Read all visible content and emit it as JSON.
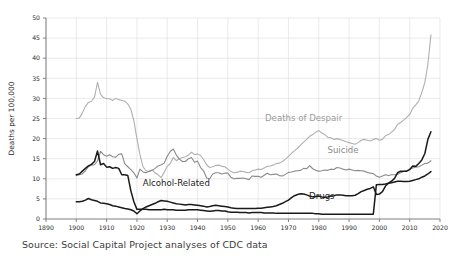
{
  "source_note": "Source: Social Capital Project analyses of CDC data",
  "chart_data": {
    "type": "line",
    "title": "",
    "xlabel": "",
    "ylabel": "Deaths per 100,000",
    "xlim": [
      1890,
      2020
    ],
    "ylim": [
      0,
      50
    ],
    "grid": true,
    "legend": "inline-labels",
    "xticks": [
      1890,
      1900,
      1910,
      1920,
      1930,
      1940,
      1950,
      1960,
      1970,
      1980,
      1990,
      2000,
      2010,
      2020
    ],
    "yticks": [
      0,
      5,
      10,
      15,
      20,
      25,
      30,
      35,
      40,
      45,
      50
    ],
    "colors": {
      "deaths_of_despair": "#b0b0b0",
      "suicide": "#8a8a8a",
      "alcohol_related": "#1a1a1a",
      "drugs": "#1a1a1a",
      "grid": "#dcdcdc",
      "axis": "#808080",
      "text": "#2b2b2b"
    },
    "annotations": [
      {
        "text": "Deaths of Despair",
        "x": 1975,
        "y": 24.5,
        "color": "#9a9a9a"
      },
      {
        "text": "Suicide",
        "x": 1988,
        "y": 16.5,
        "color": "#8a8a8a"
      },
      {
        "text": "Alcohol-Related",
        "x": 1933,
        "y": 8.2,
        "color": "#1a1a1a"
      },
      {
        "text": "Drugs",
        "x": 1981,
        "y": 5.0,
        "color": "#1a1a1a"
      }
    ],
    "series": [
      {
        "name": "Deaths of Despair",
        "color": "#b0b0b0",
        "x": [
          1900,
          1901,
          1902,
          1903,
          1904,
          1905,
          1906,
          1907,
          1908,
          1909,
          1910,
          1911,
          1912,
          1913,
          1914,
          1915,
          1916,
          1917,
          1918,
          1919,
          1920,
          1921,
          1922,
          1923,
          1924,
          1925,
          1926,
          1927,
          1928,
          1929,
          1930,
          1931,
          1932,
          1933,
          1934,
          1935,
          1936,
          1937,
          1938,
          1939,
          1940,
          1941,
          1942,
          1943,
          1944,
          1945,
          1946,
          1947,
          1948,
          1949,
          1950,
          1951,
          1952,
          1953,
          1954,
          1955,
          1956,
          1957,
          1958,
          1959,
          1960,
          1961,
          1962,
          1963,
          1964,
          1965,
          1966,
          1967,
          1968,
          1969,
          1970,
          1971,
          1972,
          1973,
          1974,
          1975,
          1976,
          1977,
          1978,
          1979,
          1980,
          1981,
          1982,
          1983,
          1984,
          1985,
          1986,
          1987,
          1988,
          1989,
          1990,
          1991,
          1992,
          1993,
          1994,
          1995,
          1996,
          1997,
          1998,
          1999,
          2000,
          2001,
          2002,
          2003,
          2004,
          2005,
          2006,
          2007,
          2008,
          2009,
          2010,
          2011,
          2012,
          2013,
          2014,
          2015,
          2016,
          2017
        ],
        "values": [
          25.0,
          25.1,
          26.4,
          28.0,
          29.0,
          29.3,
          30.3,
          34.0,
          31.0,
          30.2,
          29.9,
          29.9,
          29.5,
          30.0,
          29.7,
          29.5,
          29.3,
          28.6,
          27.3,
          24.4,
          20.0,
          16.0,
          13.0,
          12.0,
          11.8,
          12.2,
          11.5,
          11.0,
          10.3,
          11.6,
          13.1,
          13.8,
          15.3,
          14.5,
          15.0,
          15.3,
          15.5,
          15.9,
          16.6,
          16.0,
          16.2,
          15.8,
          14.8,
          13.5,
          12.8,
          13.0,
          13.3,
          13.4,
          13.1,
          13.0,
          12.4,
          11.8,
          11.5,
          11.6,
          11.9,
          11.8,
          11.6,
          11.5,
          12.0,
          12.2,
          12.4,
          12.3,
          12.7,
          13.1,
          13.2,
          13.4,
          13.8,
          13.9,
          14.3,
          14.9,
          15.6,
          16.3,
          17.0,
          17.6,
          18.4,
          19.1,
          19.8,
          20.6,
          21.0,
          21.6,
          22.0,
          21.4,
          21.0,
          20.3,
          20.2,
          19.8,
          20.0,
          19.8,
          19.5,
          19.2,
          19.0,
          18.8,
          18.6,
          19.0,
          19.6,
          19.8,
          19.6,
          19.4,
          19.8,
          20.0,
          19.6,
          19.8,
          20.7,
          21.0,
          21.6,
          22.3,
          23.5,
          24.0,
          24.6,
          25.3,
          26.0,
          27.5,
          28.4,
          29.4,
          31.5,
          34.0,
          38.5,
          45.8
        ]
      },
      {
        "name": "Suicide",
        "color": "#8a8a8a",
        "x": [
          1900,
          1901,
          1902,
          1903,
          1904,
          1905,
          1906,
          1907,
          1908,
          1909,
          1910,
          1911,
          1912,
          1913,
          1914,
          1915,
          1916,
          1917,
          1918,
          1919,
          1920,
          1921,
          1922,
          1923,
          1924,
          1925,
          1926,
          1927,
          1928,
          1929,
          1930,
          1931,
          1932,
          1933,
          1934,
          1935,
          1936,
          1937,
          1938,
          1939,
          1940,
          1941,
          1942,
          1943,
          1944,
          1945,
          1946,
          1947,
          1948,
          1949,
          1950,
          1951,
          1952,
          1953,
          1954,
          1955,
          1956,
          1957,
          1958,
          1959,
          1960,
          1961,
          1962,
          1963,
          1964,
          1965,
          1966,
          1967,
          1968,
          1969,
          1970,
          1971,
          1972,
          1973,
          1974,
          1975,
          1976,
          1977,
          1978,
          1979,
          1980,
          1981,
          1982,
          1983,
          1984,
          1985,
          1986,
          1987,
          1988,
          1989,
          1990,
          1991,
          1992,
          1993,
          1994,
          1995,
          1996,
          1997,
          1998,
          1999,
          2000,
          2001,
          2002,
          2003,
          2004,
          2005,
          2006,
          2007,
          2008,
          2009,
          2010,
          2011,
          2012,
          2013,
          2014,
          2015,
          2016,
          2017
        ],
        "values": [
          10.8,
          11.0,
          11.2,
          12.0,
          13.0,
          13.4,
          13.5,
          14.5,
          16.8,
          16.0,
          15.6,
          16.0,
          15.5,
          15.4,
          16.1,
          16.2,
          13.7,
          13.0,
          12.3,
          11.5,
          10.2,
          12.4,
          11.7,
          11.5,
          11.9,
          12.1,
          12.6,
          13.2,
          13.5,
          13.9,
          15.6,
          16.8,
          17.4,
          15.9,
          14.9,
          14.3,
          14.3,
          15.0,
          15.3,
          14.1,
          14.4,
          12.8,
          12.0,
          10.2,
          10.0,
          11.2,
          11.5,
          11.5,
          11.2,
          11.4,
          11.4,
          10.4,
          10.0,
          10.1,
          10.1,
          10.2,
          10.0,
          9.8,
          10.7,
          10.6,
          10.6,
          10.4,
          10.9,
          11.4,
          11.0,
          11.1,
          11.2,
          10.8,
          10.7,
          11.1,
          11.6,
          11.7,
          11.9,
          12.0,
          12.1,
          12.6,
          12.5,
          13.3,
          12.5,
          12.1,
          11.9,
          12.0,
          12.2,
          12.1,
          12.4,
          12.3,
          12.8,
          12.7,
          12.4,
          12.2,
          12.4,
          12.2,
          12.0,
          12.1,
          12.0,
          11.9,
          11.6,
          11.4,
          11.3,
          10.7,
          10.4,
          10.7,
          11.0,
          10.8,
          11.0,
          11.0,
          11.1,
          11.5,
          11.8,
          12.0,
          12.4,
          12.7,
          12.9,
          13.0,
          13.4,
          13.8,
          13.9,
          14.5
        ]
      },
      {
        "name": "Alcohol-Related",
        "color": "#1a1a1a",
        "x": [
          1900,
          1901,
          1902,
          1903,
          1904,
          1905,
          1906,
          1907,
          1908,
          1909,
          1910,
          1911,
          1912,
          1913,
          1914,
          1915,
          1916,
          1917,
          1918,
          1919,
          1920,
          1921,
          1922,
          1923,
          1924,
          1925,
          1926,
          1927,
          1928,
          1929,
          1930,
          1931,
          1932,
          1933,
          1934,
          1935,
          1936,
          1937,
          1938,
          1939,
          1940,
          1941,
          1942,
          1943,
          1944,
          1945,
          1946,
          1947,
          1948,
          1949,
          1950,
          1951,
          1952,
          1953,
          1954,
          1955,
          1956,
          1957,
          1958,
          1959,
          1960,
          1961,
          1962,
          1963,
          1964,
          1965,
          1966,
          1967,
          1968,
          1969,
          1970,
          1971,
          1972,
          1973,
          1974,
          1975,
          1976,
          1977,
          1978,
          1979,
          1980,
          1981,
          1982,
          1983,
          1984,
          1985,
          1986,
          1987,
          1988,
          1989,
          1990,
          1991,
          1992,
          1993,
          1994,
          1995,
          1996,
          1997,
          1998,
          1999,
          2000,
          2001,
          2002,
          2003,
          2004,
          2005,
          2006,
          2007,
          2008,
          2009,
          2010,
          2011,
          2012,
          2013,
          2014,
          2015,
          2016,
          2017
        ],
        "values": [
          11.0,
          11.2,
          11.9,
          12.6,
          13.2,
          13.6,
          14.3,
          16.9,
          13.5,
          13.8,
          12.9,
          13.0,
          12.6,
          12.8,
          12.6,
          11.0,
          11.0,
          10.8,
          7.0,
          4.3,
          2.4,
          2.4,
          2.4,
          2.4,
          2.3,
          2.3,
          2.3,
          2.3,
          2.3,
          2.4,
          2.3,
          2.3,
          2.3,
          2.2,
          2.2,
          2.2,
          2.2,
          2.3,
          2.3,
          2.3,
          2.3,
          2.2,
          2.1,
          2.0,
          1.9,
          2.0,
          2.1,
          2.1,
          2.0,
          2.0,
          1.8,
          1.7,
          1.7,
          1.7,
          1.6,
          1.6,
          1.6,
          1.5,
          1.6,
          1.6,
          1.6,
          1.6,
          1.5,
          1.5,
          1.5,
          1.5,
          1.4,
          1.4,
          1.4,
          1.4,
          1.4,
          1.4,
          1.4,
          1.4,
          1.4,
          1.4,
          1.4,
          1.4,
          1.4,
          1.3,
          1.3,
          1.2,
          1.2,
          1.2,
          1.2,
          1.2,
          1.2,
          1.2,
          1.2,
          1.2,
          1.2,
          1.2,
          1.2,
          1.2,
          1.2,
          1.2,
          1.2,
          1.2,
          1.2,
          8.5,
          8.6,
          8.6,
          8.7,
          8.9,
          9.0,
          9.2,
          9.4,
          9.4,
          9.3,
          9.3,
          9.4,
          9.6,
          9.8,
          10.0,
          10.4,
          10.7,
          11.2,
          11.8
        ]
      },
      {
        "name": "Drugs",
        "color": "#1a1a1a",
        "x": [
          1900,
          1901,
          1902,
          1903,
          1904,
          1905,
          1906,
          1907,
          1908,
          1909,
          1910,
          1911,
          1912,
          1913,
          1914,
          1915,
          1916,
          1917,
          1918,
          1919,
          1920,
          1921,
          1922,
          1923,
          1924,
          1925,
          1926,
          1927,
          1928,
          1929,
          1930,
          1931,
          1932,
          1933,
          1934,
          1935,
          1936,
          1937,
          1938,
          1939,
          1940,
          1941,
          1942,
          1943,
          1944,
          1945,
          1946,
          1947,
          1948,
          1949,
          1950,
          1951,
          1952,
          1953,
          1954,
          1955,
          1956,
          1957,
          1958,
          1959,
          1960,
          1961,
          1962,
          1963,
          1964,
          1965,
          1966,
          1967,
          1968,
          1969,
          1970,
          1971,
          1972,
          1973,
          1974,
          1975,
          1976,
          1977,
          1978,
          1979,
          1980,
          1981,
          1982,
          1983,
          1984,
          1985,
          1986,
          1987,
          1988,
          1989,
          1990,
          1991,
          1992,
          1993,
          1994,
          1995,
          1996,
          1997,
          1998,
          1999,
          2000,
          2001,
          2002,
          2003,
          2004,
          2005,
          2006,
          2007,
          2008,
          2009,
          2010,
          2011,
          2012,
          2013,
          2014,
          2015,
          2016,
          2017
        ],
        "values": [
          4.3,
          4.3,
          4.4,
          4.7,
          5.1,
          4.8,
          4.6,
          4.4,
          4.0,
          3.9,
          3.8,
          3.6,
          3.3,
          3.2,
          3.0,
          2.8,
          2.6,
          2.5,
          2.3,
          2.0,
          1.3,
          2.0,
          2.6,
          3.0,
          3.3,
          3.6,
          3.9,
          4.3,
          4.6,
          4.5,
          4.4,
          4.2,
          4.0,
          3.8,
          3.7,
          3.6,
          3.5,
          3.6,
          3.6,
          3.5,
          3.4,
          3.3,
          3.2,
          3.0,
          3.1,
          3.3,
          3.4,
          3.3,
          3.2,
          3.1,
          3.0,
          2.8,
          2.7,
          2.6,
          2.6,
          2.6,
          2.6,
          2.6,
          2.6,
          2.6,
          2.7,
          2.7,
          2.8,
          2.9,
          3.0,
          3.1,
          3.3,
          3.6,
          3.9,
          4.3,
          4.7,
          5.3,
          5.8,
          6.1,
          6.3,
          6.2,
          6.0,
          5.7,
          5.5,
          5.6,
          5.7,
          5.5,
          5.4,
          5.5,
          5.7,
          5.8,
          6.0,
          6.0,
          5.9,
          5.8,
          5.8,
          5.8,
          5.9,
          6.3,
          6.8,
          7.1,
          7.4,
          7.6,
          8.0,
          6.1,
          6.2,
          6.8,
          8.2,
          8.9,
          9.4,
          10.1,
          11.5,
          11.9,
          11.9,
          11.9,
          12.3,
          13.2,
          13.1,
          13.8,
          14.7,
          16.3,
          19.8,
          21.7
        ]
      }
    ]
  }
}
